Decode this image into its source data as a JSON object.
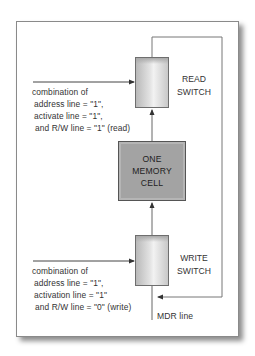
{
  "diagram": {
    "read_switch": {
      "line1": "READ",
      "line2": "SWITCH"
    },
    "memory_cell": {
      "line1": "ONE",
      "line2": "MEMORY",
      "line3": "CELL"
    },
    "write_switch": {
      "line1": "WRITE",
      "line2": "SWITCH"
    },
    "read_condition": {
      "line1": "combination of",
      "line2": "address line = \"1\",",
      "line3": "activate line = \"1\",",
      "line4": "and R/W line = \"1\" (read)"
    },
    "write_condition": {
      "line1": "combination of",
      "line2": "address line = \"1\",",
      "line3": "activation line = \"1\"",
      "line4": "and R/W line = \"0\" (write)"
    },
    "mdr_label": "MDR line"
  },
  "colors": {
    "frame_border": "#8a8a8a",
    "line": "#555555",
    "cell_fill": "#a3a3a3",
    "switch_fill": "#e4e4e4"
  }
}
